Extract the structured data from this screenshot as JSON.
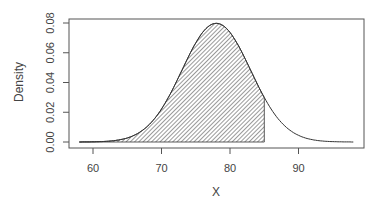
{
  "chart_data": {
    "type": "area",
    "title": "",
    "xlabel": "X",
    "ylabel": "Density",
    "distribution": {
      "name": "normal",
      "mean": 78,
      "sd": 5
    },
    "x_range": [
      58,
      98
    ],
    "shaded_region": {
      "from": 58,
      "to": 85,
      "style": "hatched"
    },
    "xlim": [
      57.5,
      99.5
    ],
    "ylim": [
      -0.0033,
      0.0807
    ],
    "x_ticks": [
      60,
      70,
      80,
      90
    ],
    "x_tick_labels": [
      "60",
      "70",
      "80",
      "90"
    ],
    "y_ticks": [
      0.0,
      0.02,
      0.04,
      0.06,
      0.08
    ],
    "y_tick_labels": [
      "0.00",
      "0.02",
      "0.04",
      "0.06",
      "0.08"
    ],
    "grid": false,
    "legend": null
  },
  "colors": {
    "line": "#333333",
    "hatch": "#555555",
    "axis": "#666666",
    "text": "#444444"
  }
}
